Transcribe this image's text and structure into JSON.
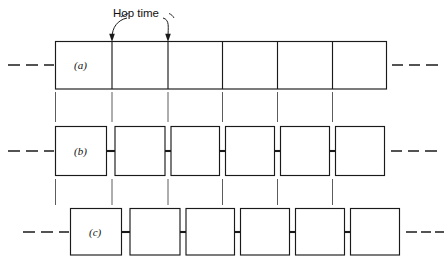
{
  "figure": {
    "annotation": {
      "hop_time_label": "Hop time",
      "arrow_left_x": 112,
      "arrow_right_x": 168
    },
    "geometry": {
      "strip_left": 55,
      "strip_right": 387,
      "cell_count": 6,
      "cell_width": 55.3,
      "row_a_top": 41,
      "row_a_bottom": 89,
      "row_b_top": 126,
      "row_b_bottom": 176,
      "row_c_top": 208,
      "row_c_bottom": 255,
      "row_c_offset_x": 15,
      "box_inset": 3
    },
    "rows": [
      {
        "id": "a",
        "label": "(a)",
        "style": "contiguous",
        "cells": 6,
        "left_dashes": 3,
        "right_dashes": 3
      },
      {
        "id": "b",
        "label": "(b)",
        "style": "separated-connected",
        "cells": 6,
        "left_dashes": 3,
        "right_dashes": 3
      },
      {
        "id": "c",
        "label": "(c)",
        "style": "separated-connected-offset",
        "cells": 6,
        "left_dashes": 3,
        "right_dashes": 3
      }
    ],
    "colors": {
      "stroke": "#1a1a1a",
      "guide": "#4a4a4a",
      "background": "#ffffff"
    }
  }
}
